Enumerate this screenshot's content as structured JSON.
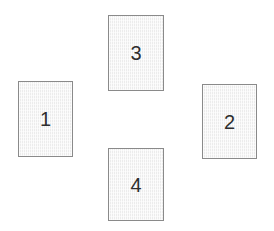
{
  "canvas": {
    "width": 274,
    "height": 231,
    "background_color": "#ffffff"
  },
  "diagram": {
    "type": "rectangle-arrangement",
    "style": {
      "fill_color": "#f2f2f2",
      "border_color": "#8a8a8a",
      "border_width": 1,
      "label_color": "#2e2e2e",
      "label_font_size": 20
    },
    "cards": [
      {
        "id": "card-1",
        "label": "1",
        "position": "left",
        "x": 18,
        "y": 81,
        "width": 55,
        "height": 76
      },
      {
        "id": "card-2",
        "label": "2",
        "position": "right",
        "x": 202,
        "y": 84,
        "width": 55,
        "height": 75
      },
      {
        "id": "card-3",
        "label": "3",
        "position": "top",
        "x": 108,
        "y": 15,
        "width": 56,
        "height": 76
      },
      {
        "id": "card-4",
        "label": "4",
        "position": "bottom",
        "x": 108,
        "y": 148,
        "width": 56,
        "height": 73
      }
    ]
  }
}
